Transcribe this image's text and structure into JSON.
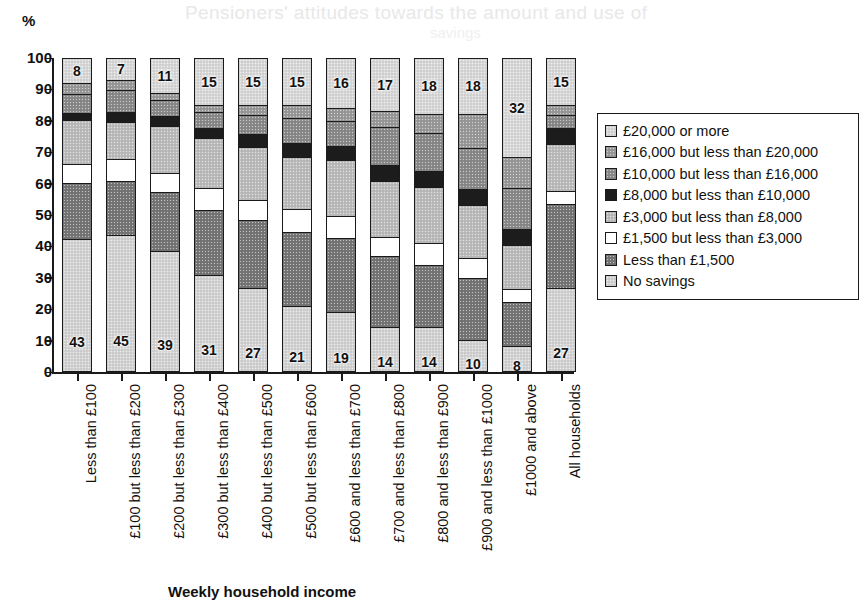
{
  "page": {
    "axis_unit_label": "%",
    "ghost_text": "Pensioners' attitudes towards the amount and use of",
    "ghost_text2": "savings"
  },
  "chart_data": {
    "type": "bar",
    "subtype": "stacked-bar-100",
    "title": "",
    "xlabel": "Weekly household income",
    "ylabel": "%",
    "ylim": [
      0,
      100
    ],
    "yticks": [
      0,
      10,
      20,
      30,
      40,
      50,
      60,
      70,
      80,
      90,
      100
    ],
    "grid": false,
    "legend_position": "right",
    "categories": [
      "Less than £100",
      "£100 but less than £200",
      "£200 but less than £300",
      "£300 but less than £400",
      "£400 but less than £500",
      "£500 but less than £600",
      "£600 and less than £700",
      "£700 and less than £800",
      "£800 and less than £900",
      "£900 and less than £1000",
      "£1000 and above",
      "All households"
    ],
    "series": [
      {
        "name": "No savings",
        "swatch": "#d4d4d4",
        "values": [
          43,
          45,
          39,
          31,
          27,
          21,
          19,
          14,
          14,
          10,
          8,
          27
        ],
        "labels": [
          "43",
          "45",
          "39",
          "31",
          "27",
          "21",
          "19",
          "14",
          "14",
          "10",
          "8",
          "27"
        ]
      },
      {
        "name": "Less than £1,500",
        "swatch": "#767676",
        "values": [
          18,
          18,
          19,
          21,
          22,
          24,
          24,
          23,
          20,
          20,
          14,
          27
        ],
        "labels": [
          "",
          "",
          "",
          "",
          "",
          "",
          "",
          "",
          "",
          "",
          "",
          ""
        ]
      },
      {
        "name": "£1,500 but less than £3,000",
        "swatch": "#ffffff",
        "values": [
          6,
          7,
          6,
          7,
          6,
          7,
          7,
          6,
          7,
          6,
          4,
          4
        ],
        "labels": [
          "",
          "",
          "",
          "",
          "",
          "",
          "",
          "",
          "",
          "",
          "",
          ""
        ]
      },
      {
        "name": "£3,000 but less than £8,000",
        "swatch": "#bdbdbd",
        "values": [
          14,
          12,
          15,
          16,
          17,
          17,
          18,
          18,
          18,
          17,
          14,
          15
        ],
        "labels": [
          "",
          "",
          "",
          "",
          "",
          "",
          "",
          "",
          "",
          "",
          "",
          ""
        ]
      },
      {
        "name": "£8,000 but less than £10,000",
        "swatch": "#1c1c1c",
        "values": [
          2,
          3,
          3,
          3,
          4,
          4,
          4,
          5,
          5,
          5,
          5,
          5
        ],
        "labels": [
          "",
          "",
          "",
          "",
          "",
          "",
          "",
          "",
          "",
          "",
          "",
          ""
        ]
      },
      {
        "name": "£10,000 but less than £16,000",
        "swatch": "#8a8a8a",
        "values": [
          6,
          7,
          5,
          5,
          6,
          8,
          8,
          12,
          12,
          13,
          13,
          4
        ],
        "labels": [
          "",
          "",
          "",
          "",
          "",
          "",
          "",
          "",
          "",
          "",
          "",
          ""
        ]
      },
      {
        "name": "£16,000 but less than £20,000",
        "swatch": "#9a9a9a",
        "values": [
          3,
          3,
          2,
          2,
          3,
          4,
          4,
          5,
          6,
          11,
          10,
          3
        ],
        "labels": [
          "",
          "",
          "",
          "",
          "",
          "",
          "",
          "",
          "",
          "",
          "",
          ""
        ]
      },
      {
        "name": "£20,000 or more",
        "swatch": "#d9d9d9",
        "values": [
          8,
          7,
          11,
          15,
          15,
          15,
          16,
          17,
          18,
          18,
          32,
          15
        ],
        "labels": [
          "8",
          "7",
          "11",
          "15",
          "15",
          "15",
          "16",
          "17",
          "18",
          "18",
          "32",
          "15"
        ]
      }
    ]
  },
  "legend": {
    "items": [
      {
        "label": "£20,000 or more",
        "swatch": "#d9d9d9"
      },
      {
        "label": "£16,000 but less than £20,000",
        "swatch": "#9a9a9a"
      },
      {
        "label": "£10,000 but less than £16,000",
        "swatch": "#8a8a8a"
      },
      {
        "label": "£8,000 but less than £10,000",
        "swatch": "#1c1c1c"
      },
      {
        "label": "£3,000 but less than £8,000",
        "swatch": "#bdbdbd"
      },
      {
        "label": "£1,500 but less than £3,000",
        "swatch": "#ffffff"
      },
      {
        "label": "Less than £1,500",
        "swatch": "#767676"
      },
      {
        "label": "No savings",
        "swatch": "#d4d4d4"
      }
    ]
  }
}
